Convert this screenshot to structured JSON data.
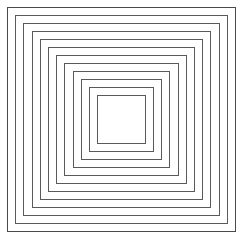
{
  "figure": {
    "title": "Concentric Squares",
    "type": "nested-squares-diagram",
    "canvas_width": 243,
    "canvas_height": 240,
    "background_color": "#ffffff",
    "stroke_color": "#5a5a5a",
    "stroke_width_px": 1,
    "ring_count": 12,
    "outer_left": 7,
    "outer_top": 7,
    "outer_width": 229,
    "outer_height": 225,
    "inset_step_x": 8.2,
    "inset_step_y": 8.0,
    "squares": [
      {
        "index": 1,
        "label": "square-ring-1",
        "left": 7.0,
        "top": 7.0,
        "width": 229.0,
        "height": 225.0,
        "stroke": "#4a4a4a"
      },
      {
        "index": 2,
        "label": "square-ring-2",
        "left": 15.2,
        "top": 15.0,
        "width": 212.6,
        "height": 209.0,
        "stroke": "#5a5a5a"
      },
      {
        "index": 3,
        "label": "square-ring-3",
        "left": 23.4,
        "top": 23.0,
        "width": 196.2,
        "height": 193.0,
        "stroke": "#5a5a5a"
      },
      {
        "index": 4,
        "label": "square-ring-4",
        "left": 31.6,
        "top": 31.0,
        "width": 179.8,
        "height": 177.0,
        "stroke": "#5a5a5a"
      },
      {
        "index": 5,
        "label": "square-ring-5",
        "left": 39.8,
        "top": 39.0,
        "width": 163.4,
        "height": 161.0,
        "stroke": "#5a5a5a"
      },
      {
        "index": 6,
        "label": "square-ring-6",
        "left": 48.0,
        "top": 47.0,
        "width": 147.0,
        "height": 145.0,
        "stroke": "#5a5a5a"
      },
      {
        "index": 7,
        "label": "square-ring-7",
        "left": 56.2,
        "top": 55.0,
        "width": 130.6,
        "height": 129.0,
        "stroke": "#5a5a5a"
      },
      {
        "index": 8,
        "label": "square-ring-8",
        "left": 64.4,
        "top": 63.0,
        "width": 114.2,
        "height": 113.0,
        "stroke": "#5a5a5a"
      },
      {
        "index": 9,
        "label": "square-ring-9",
        "left": 72.6,
        "top": 71.0,
        "width": 97.8,
        "height": 97.0,
        "stroke": "#5a5a5a"
      },
      {
        "index": 10,
        "label": "square-ring-10",
        "left": 80.8,
        "top": 79.0,
        "width": 81.4,
        "height": 81.0,
        "stroke": "#5a5a5a"
      },
      {
        "index": 11,
        "label": "square-ring-11",
        "left": 89.0,
        "top": 87.0,
        "width": 65.0,
        "height": 65.0,
        "stroke": "#5a5a5a"
      },
      {
        "index": 12,
        "label": "square-ring-12",
        "left": 97.2,
        "top": 95.0,
        "width": 48.6,
        "height": 49.0,
        "stroke": "#5a5a5a"
      }
    ]
  }
}
